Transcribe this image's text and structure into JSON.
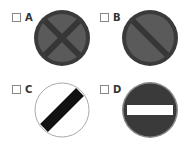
{
  "question": {
    "options": [
      {
        "label": "A",
        "sign": "no-stopping-icon",
        "colors": {
          "ring": "#3a3a3a",
          "fill": "#5a5a5a",
          "cross": "#363636"
        }
      },
      {
        "label": "B",
        "sign": "no-waiting-icon",
        "colors": {
          "ring": "#3a3a3a",
          "fill": "#5a5a5a",
          "bar": "#363636"
        }
      },
      {
        "label": "C",
        "sign": "national-speed-limit-icon",
        "colors": {
          "ring": "#aaaaaa",
          "fill": "#ffffff",
          "bar": "#111111"
        }
      },
      {
        "label": "D",
        "sign": "no-entry-icon",
        "colors": {
          "ring": "#888888",
          "fill": "#3a3a3a",
          "bar": "#ffffff"
        }
      }
    ]
  }
}
